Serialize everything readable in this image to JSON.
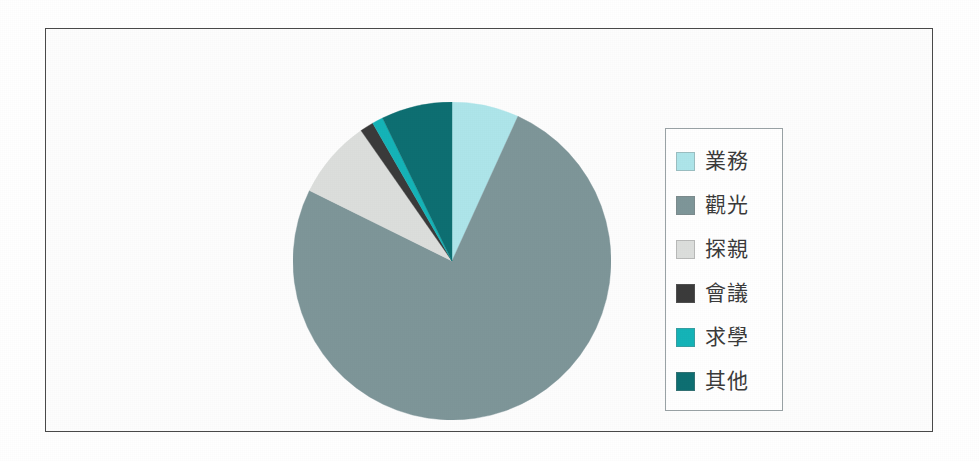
{
  "figure": {
    "background_color": "#ffffff",
    "frame_border_color": "#4a4a4a",
    "legend_border_color": "#9aa3a6"
  },
  "chart_data": {
    "type": "pie",
    "title": "",
    "xlabel": "",
    "ylabel": "",
    "legend_position": "right",
    "grid": false,
    "start_angle_deg": 90,
    "direction": "clockwise",
    "categories": [
      "業務",
      "觀光",
      "探親",
      "會議",
      "求學",
      "其他"
    ],
    "values": [
      6.8,
      75.5,
      8.0,
      1.4,
      1.1,
      7.2
    ],
    "unit": "%",
    "colors": [
      "#AEE5EA",
      "#7E9699",
      "#DCDEDC",
      "#3B3B3B",
      "#15B4B8",
      "#0E6F72"
    ],
    "slices": [
      {
        "label": "業務",
        "value": 6.8,
        "color": "#AEE5EA",
        "start_deg": 0.0,
        "sweep_deg": 24.5
      },
      {
        "label": "觀光",
        "value": 75.5,
        "color": "#7E9699",
        "start_deg": 24.5,
        "sweep_deg": 271.8
      },
      {
        "label": "探親",
        "value": 8.0,
        "color": "#DCDEDC",
        "start_deg": 296.3,
        "sweep_deg": 28.8
      },
      {
        "label": "會議",
        "value": 1.4,
        "color": "#3B3B3B",
        "start_deg": 325.1,
        "sweep_deg": 5.0
      },
      {
        "label": "求學",
        "value": 1.1,
        "color": "#15B4B8",
        "start_deg": 330.1,
        "sweep_deg": 4.0
      },
      {
        "label": "其他",
        "value": 7.2,
        "color": "#0E6F72",
        "start_deg": 334.1,
        "sweep_deg": 25.9
      }
    ]
  },
  "legend": {
    "items": [
      {
        "label": "業務",
        "color": "#AEE5EA"
      },
      {
        "label": "觀光",
        "color": "#7E9699"
      },
      {
        "label": "探親",
        "color": "#DCDEDC"
      },
      {
        "label": "會議",
        "color": "#3B3B3B"
      },
      {
        "label": "求學",
        "color": "#15B4B8"
      },
      {
        "label": "其他",
        "color": "#0E6F72"
      }
    ]
  }
}
